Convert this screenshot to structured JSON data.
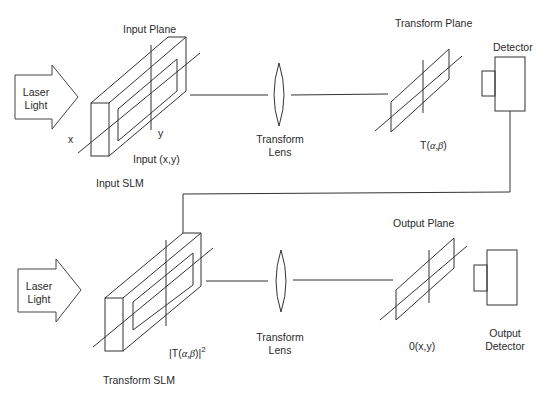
{
  "diagram": {
    "type": "optical-correlator",
    "stroke_color": "#333333",
    "background": "#ffffff"
  },
  "top_stage": {
    "laser": {
      "line1": "Laser",
      "line2": "Light"
    },
    "input_plane_label": "Input Plane",
    "axis_x_label": "x",
    "axis_y_label": "y",
    "input_label": "Input (x,y)",
    "slm_label": "Input SLM",
    "lens": {
      "line1": "Transform",
      "line2": "Lens"
    },
    "transform_plane_label": "Transform Plane",
    "transform_value": {
      "prefix": "T(",
      "vars": "α,β",
      "suffix": ")"
    },
    "detector_label": "Detector"
  },
  "bottom_stage": {
    "laser": {
      "line1": "Laser",
      "line2": "Light"
    },
    "slm_value": {
      "prefix": "|T(",
      "vars": "α,β",
      "suffix": ")|",
      "exp": "2"
    },
    "slm_label": "Transform SLM",
    "lens": {
      "line1": "Transform",
      "line2": "Lens"
    },
    "output_plane_label": "Output Plane",
    "output_value": "0(x,y)",
    "detector": {
      "line1": "Output",
      "line2": "Detector"
    }
  }
}
